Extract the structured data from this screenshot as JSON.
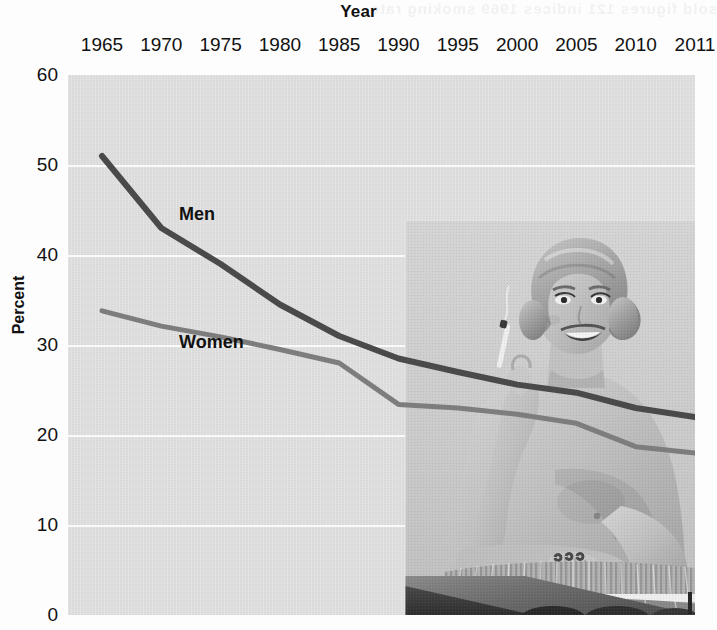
{
  "chart_data": {
    "type": "line",
    "title": "Year",
    "xlabel": "Year",
    "ylabel": "Percent",
    "grid": true,
    "legend_position": "inline-labels",
    "xlim": [
      1965,
      2011
    ],
    "ylim": [
      0,
      60
    ],
    "ytick_labels": [
      "0",
      "10",
      "20",
      "30",
      "40",
      "50",
      "60"
    ],
    "yticks": [
      0,
      10,
      20,
      30,
      40,
      50,
      60
    ],
    "xtick_labels": [
      "1965",
      "1970",
      "1975",
      "1980",
      "1985",
      "1990",
      "1995",
      "2000",
      "2005",
      "2010",
      "2011"
    ],
    "x": [
      1965,
      1970,
      1975,
      1980,
      1985,
      1990,
      1995,
      2000,
      2005,
      2010,
      2011
    ],
    "series": [
      {
        "name": "Men",
        "color": "#4a4a4a",
        "values": [
          51.0,
          43.0,
          39.0,
          34.5,
          31.0,
          28.5,
          27.0,
          25.6,
          24.7,
          23.0,
          22.0
        ]
      },
      {
        "name": "Women",
        "color": "#7d7d7d",
        "values": [
          33.8,
          32.1,
          30.9,
          29.5,
          28.0,
          23.4,
          23.0,
          22.3,
          21.3,
          18.7,
          18.0
        ]
      }
    ],
    "annotations": [
      {
        "text": "Men",
        "x": 1971.5,
        "y": 44.5
      },
      {
        "text": "Women",
        "x": 1971.5,
        "y": 30.2
      }
    ],
    "overlay_image": {
      "name": "vintage-woman-smoking-photo",
      "description": "black-and-white photograph of a smiling blonde woman holding a cigarette",
      "grayscale": true
    },
    "plot_background": "#dddddd",
    "gridline_color": "#fafafa",
    "page_background": "#fdfdfd"
  },
  "bleed_text": "sold figures 121 indices 1969 smoking rate"
}
